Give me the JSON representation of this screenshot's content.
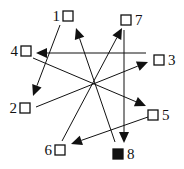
{
  "diagram": {
    "type": "directed-graph",
    "colors": {
      "stroke": "#111111",
      "background": "#ffffff",
      "filled_node": "#111111"
    },
    "nodes": [
      {
        "id": "1",
        "label": "1",
        "x": 68,
        "y": 16,
        "filled": false,
        "label_side": "left"
      },
      {
        "id": "2",
        "label": "2",
        "x": 25,
        "y": 108,
        "filled": false,
        "label_side": "left"
      },
      {
        "id": "3",
        "label": "3",
        "x": 159,
        "y": 60,
        "filled": false,
        "label_side": "right"
      },
      {
        "id": "4",
        "label": "4",
        "x": 26,
        "y": 51,
        "filled": false,
        "label_side": "left"
      },
      {
        "id": "5",
        "label": "5",
        "x": 153,
        "y": 115,
        "filled": false,
        "label_side": "right"
      },
      {
        "id": "6",
        "label": "6",
        "x": 60,
        "y": 150,
        "filled": false,
        "label_side": "left"
      },
      {
        "id": "7",
        "label": "7",
        "x": 126,
        "y": 20,
        "filled": false,
        "label_side": "right"
      },
      {
        "id": "8",
        "label": "8",
        "x": 118,
        "y": 154,
        "filled": true,
        "label_side": "right"
      }
    ],
    "edges": [
      {
        "from": "1",
        "to": "2",
        "x1": 60,
        "y1": 25,
        "x2": 33,
        "y2": 96
      },
      {
        "from": "3",
        "to": "4",
        "x1": 146,
        "y1": 53,
        "x2": 36,
        "y2": 53
      },
      {
        "from": "4",
        "to": "5",
        "x1": 33,
        "y1": 58,
        "x2": 146,
        "y2": 106
      },
      {
        "from": "2",
        "to": "3",
        "x1": 36,
        "y1": 107,
        "x2": 148,
        "y2": 62
      },
      {
        "from": "6",
        "to": "7",
        "x1": 62,
        "y1": 141,
        "x2": 122,
        "y2": 28
      },
      {
        "from": "8",
        "to": "1",
        "x1": 115,
        "y1": 142,
        "x2": 76,
        "y2": 28
      },
      {
        "from": "7",
        "to": "8",
        "x1": 124,
        "y1": 30,
        "x2": 124,
        "y2": 143
      },
      {
        "from": "5",
        "to": "6",
        "x1": 148,
        "y1": 117,
        "x2": 71,
        "y2": 144
      }
    ]
  }
}
